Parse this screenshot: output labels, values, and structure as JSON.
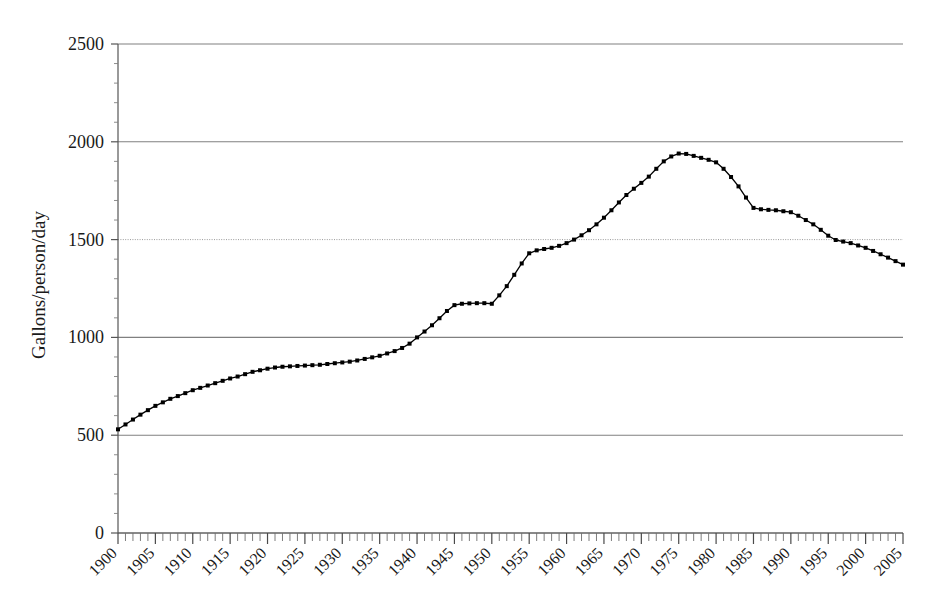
{
  "chart_data": {
    "type": "line",
    "title": "",
    "xlabel": "",
    "ylabel": "Gallons/person/day",
    "xlim": [
      1900,
      2005
    ],
    "ylim": [
      0,
      2500
    ],
    "y_ticks": [
      0,
      500,
      1000,
      1500,
      2000,
      2500
    ],
    "y_tick_labels": [
      "0",
      "500",
      "1000",
      "1500",
      "2000",
      "2500"
    ],
    "x_ticks": [
      1900,
      1905,
      1910,
      1915,
      1920,
      1925,
      1930,
      1935,
      1940,
      1945,
      1950,
      1955,
      1960,
      1965,
      1970,
      1975,
      1980,
      1985,
      1990,
      1995,
      2000,
      2005
    ],
    "x_tick_labels": [
      "1900",
      "1905",
      "1910",
      "1915",
      "1920",
      "1925",
      "1930",
      "1935",
      "1940",
      "1945",
      "1950",
      "1955",
      "1960",
      "1965",
      "1970",
      "1975",
      "1980",
      "1985",
      "1990",
      "1995",
      "2000",
      "2005"
    ],
    "x_minor_tick_interval": 1,
    "x_tick_label_rotation_deg": 45,
    "grid": "horizontal-major",
    "legend": "none",
    "marker": "square",
    "line_color": "#000000",
    "marker_color": "#000000",
    "grid_color": "#808080",
    "axis_color": "#555555",
    "x": [
      1900,
      1901,
      1902,
      1903,
      1904,
      1905,
      1906,
      1907,
      1908,
      1909,
      1910,
      1911,
      1912,
      1913,
      1914,
      1915,
      1916,
      1917,
      1918,
      1919,
      1920,
      1921,
      1922,
      1923,
      1924,
      1925,
      1926,
      1927,
      1928,
      1929,
      1930,
      1931,
      1932,
      1933,
      1934,
      1935,
      1936,
      1937,
      1938,
      1939,
      1940,
      1941,
      1942,
      1943,
      1944,
      1945,
      1946,
      1947,
      1948,
      1949,
      1950,
      1951,
      1952,
      1953,
      1954,
      1955,
      1956,
      1957,
      1958,
      1959,
      1960,
      1961,
      1962,
      1963,
      1964,
      1965,
      1966,
      1967,
      1968,
      1969,
      1970,
      1971,
      1972,
      1973,
      1974,
      1975,
      1976,
      1977,
      1978,
      1979,
      1980,
      1981,
      1982,
      1983,
      1984,
      1985,
      1986,
      1987,
      1988,
      1989,
      1990,
      1991,
      1992,
      1993,
      1994,
      1995,
      1996,
      1997,
      1998,
      1999,
      2000,
      2001,
      2002,
      2003,
      2004,
      2005
    ],
    "values": [
      530,
      555,
      580,
      605,
      628,
      650,
      668,
      686,
      700,
      715,
      730,
      742,
      754,
      766,
      778,
      790,
      800,
      812,
      824,
      832,
      840,
      846,
      850,
      852,
      854,
      856,
      858,
      860,
      864,
      868,
      872,
      876,
      882,
      890,
      898,
      906,
      918,
      930,
      946,
      968,
      1000,
      1030,
      1062,
      1098,
      1135,
      1165,
      1172,
      1174,
      1175,
      1175,
      1172,
      1215,
      1262,
      1320,
      1378,
      1430,
      1445,
      1452,
      1458,
      1468,
      1482,
      1500,
      1522,
      1548,
      1578,
      1612,
      1650,
      1690,
      1728,
      1760,
      1790,
      1822,
      1862,
      1900,
      1925,
      1940,
      1938,
      1928,
      1918,
      1908,
      1895,
      1862,
      1820,
      1772,
      1715,
      1662,
      1655,
      1652,
      1650,
      1645,
      1640,
      1622,
      1600,
      1578,
      1550,
      1520,
      1498,
      1490,
      1482,
      1470,
      1458,
      1442,
      1425,
      1408,
      1390,
      1372
    ]
  }
}
